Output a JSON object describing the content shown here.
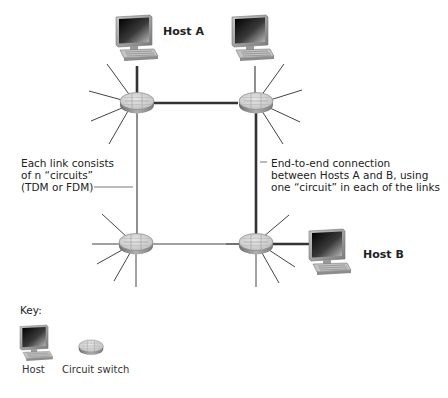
{
  "hosts": {
    "a_label": "Host A",
    "b_label": "Host B"
  },
  "annotations": {
    "left": [
      "Each link consists",
      "of n “circuits”",
      "(TDM or FDM)"
    ],
    "right": [
      "End-to-end connection",
      "between Hosts A and B, using",
      "one “circuit” in each of the links"
    ]
  },
  "key": {
    "title": "Key:",
    "items": [
      {
        "icon": "host-icon",
        "label": "Host"
      },
      {
        "icon": "circuit-switch-icon",
        "label": "Circuit switch"
      }
    ]
  },
  "colors": {
    "link": "#444444",
    "switch_top": "#d0d0d0",
    "switch_side": "#8a8a8a",
    "monitor_frame": "#9a9a9a",
    "screen": "#1a1a1a"
  }
}
